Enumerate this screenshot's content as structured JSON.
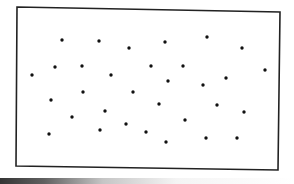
{
  "figure": {
    "frame": {
      "corners": {
        "top_left": [
          17,
          7
        ],
        "top_right": [
          280,
          12
        ],
        "bottom_right": [
          278,
          170
        ],
        "bottom_left": [
          16,
          166
        ]
      },
      "stroke_color": "#222222",
      "stroke_width": 1.6
    },
    "dot_color": "#111111",
    "dot_radius": 1.7,
    "dot_count": 32,
    "dots": [
      {
        "x": 62,
        "y": 40
      },
      {
        "x": 99,
        "y": 41
      },
      {
        "x": 129,
        "y": 48
      },
      {
        "x": 165,
        "y": 42
      },
      {
        "x": 207,
        "y": 37
      },
      {
        "x": 242,
        "y": 48
      },
      {
        "x": 32,
        "y": 75
      },
      {
        "x": 55,
        "y": 67
      },
      {
        "x": 82,
        "y": 66
      },
      {
        "x": 111,
        "y": 75
      },
      {
        "x": 151,
        "y": 66
      },
      {
        "x": 183,
        "y": 66
      },
      {
        "x": 168,
        "y": 81
      },
      {
        "x": 226,
        "y": 78
      },
      {
        "x": 203,
        "y": 85
      },
      {
        "x": 265,
        "y": 70
      },
      {
        "x": 51,
        "y": 100
      },
      {
        "x": 83,
        "y": 92
      },
      {
        "x": 133,
        "y": 92
      },
      {
        "x": 159,
        "y": 104
      },
      {
        "x": 217,
        "y": 105
      },
      {
        "x": 244,
        "y": 112
      },
      {
        "x": 105,
        "y": 111
      },
      {
        "x": 72,
        "y": 117
      },
      {
        "x": 185,
        "y": 120
      },
      {
        "x": 126,
        "y": 124
      },
      {
        "x": 49,
        "y": 134
      },
      {
        "x": 100,
        "y": 130
      },
      {
        "x": 146,
        "y": 132
      },
      {
        "x": 166,
        "y": 142
      },
      {
        "x": 206,
        "y": 138
      },
      {
        "x": 237,
        "y": 138
      }
    ],
    "bottom_shadow_color": "#111111"
  }
}
